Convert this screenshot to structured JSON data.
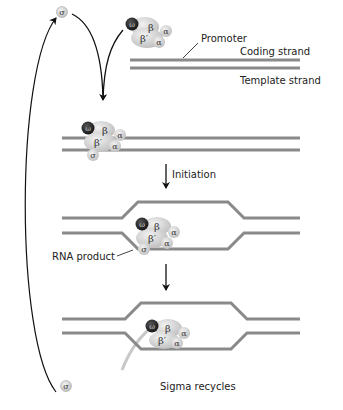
{
  "diagram": {
    "colors": {
      "strand": "#8a8a8a",
      "arrow": "#111111",
      "rna": "#c8c8c8",
      "subunit_fill": "#d6d6d6",
      "omega_fill": "#1a1a1a",
      "text": "#222222"
    },
    "labels": {
      "promoter": "Promoter",
      "coding_strand": "Coding strand",
      "template_strand": "Template strand",
      "initiation": "Initiation",
      "rna_product": "RNA product",
      "sigma_recycles": "Sigma recycles"
    },
    "subunits": {
      "omega": "ω",
      "beta": "β",
      "beta_prime": "β′",
      "alpha": "α",
      "sigma": "σ"
    },
    "stages": [
      {
        "name": "free-sigma-and-core"
      },
      {
        "name": "holoenzyme-bound-to-promoter"
      },
      {
        "name": "open-complex-initiation"
      },
      {
        "name": "elongation-sigma-released"
      }
    ]
  }
}
